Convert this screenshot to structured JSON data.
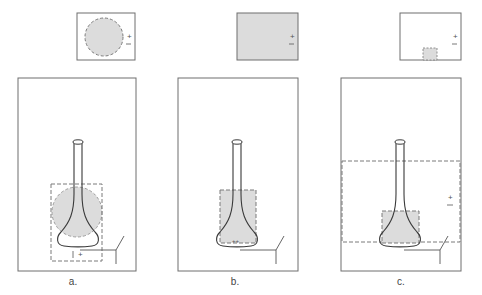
{
  "colors": {
    "frame": "#6e6e6e",
    "dashed": "#7a7a7a",
    "fill": "#dcdcdc",
    "flask": "#3a3a3a",
    "background": "#ffffff"
  },
  "panels": [
    {
      "id": "a",
      "label": "a.",
      "inset_shape": "circle",
      "inset_signs": [
        "+",
        "–"
      ],
      "region_signs": "+"
    },
    {
      "id": "b",
      "label": "b.",
      "inset_shape": "filled-rectangle",
      "inset_signs": [
        "+",
        "–"
      ],
      "region_signs": "++"
    },
    {
      "id": "c",
      "label": "c.",
      "inset_shape": "small-square",
      "inset_signs": [
        "+",
        "–"
      ],
      "region_signs": [
        "+",
        "–"
      ]
    }
  ]
}
